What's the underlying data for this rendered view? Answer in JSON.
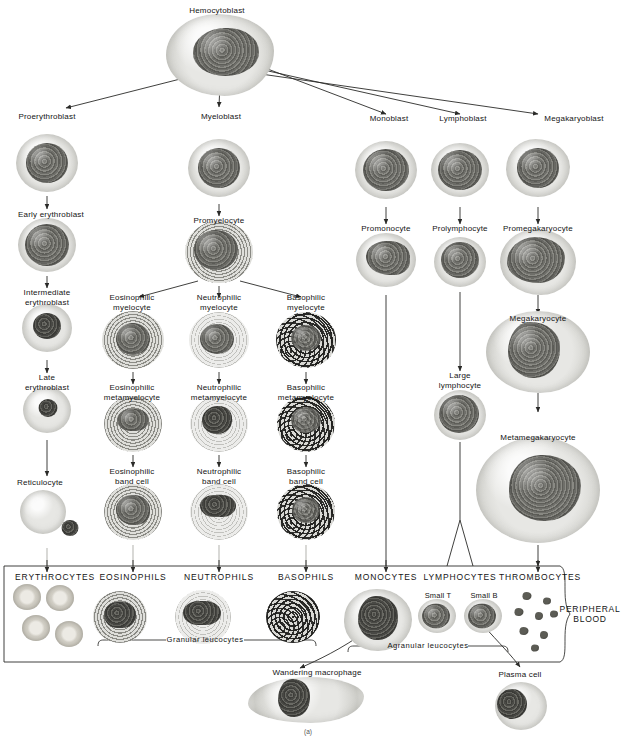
{
  "figure": {
    "caption": "(a)",
    "peripheral_blood_label": "PERIPHERAL\nBLOOD",
    "granular_bracket": "Granular  leucocytes",
    "agranular_bracket": "Agranular  leucocytes"
  },
  "stem": {
    "label": "Hemocytoblast"
  },
  "lineages": {
    "erythroid": {
      "name": "erythroid",
      "stages": [
        {
          "label": "Proerythroblast"
        },
        {
          "label": "Early erythroblast"
        },
        {
          "label": "Intermediate\nerythroblast"
        },
        {
          "label": "Late\nerythroblast"
        },
        {
          "label": "Reticulocyte"
        }
      ]
    },
    "myeloid": {
      "name": "myeloid",
      "blast": {
        "label": "Myeloblast"
      },
      "pro": {
        "label": "Promyelocyte"
      },
      "branches": [
        {
          "name": "eosinophilic",
          "stages": [
            {
              "label": "Eosinophilic\nmyelocyte"
            },
            {
              "label": "Eosinophilic\nmetamyelocyte"
            },
            {
              "label": "Eosinophilic\nband cell"
            }
          ]
        },
        {
          "name": "neutrophilic",
          "stages": [
            {
              "label": "Neutrophilic\nmyelocyte"
            },
            {
              "label": "Neutrophilic\nmetamyelocyte"
            },
            {
              "label": "Neutrophilic\nband cell"
            }
          ]
        },
        {
          "name": "basophilic",
          "stages": [
            {
              "label": "Basophilic\nmyelocyte"
            },
            {
              "label": "Basophilic\nmetamyelocyte"
            },
            {
              "label": "Basophilic\nband cell"
            }
          ]
        }
      ]
    },
    "monocytic": {
      "name": "monocytic",
      "stages": [
        {
          "label": "Monoblast"
        },
        {
          "label": "Promonocyte"
        }
      ]
    },
    "lymphoid": {
      "name": "lymphoid",
      "stages": [
        {
          "label": "Lymphoblast"
        },
        {
          "label": "Prolymphocyte"
        },
        {
          "label": "Large\nlymphocyte"
        }
      ]
    },
    "megakaryocytic": {
      "name": "megakaryocytic",
      "stages": [
        {
          "label": "Megakaryoblast"
        },
        {
          "label": "Promegakaryocyte"
        },
        {
          "label": "Megakaryocyte"
        },
        {
          "label": "Metamegakaryocyte"
        }
      ]
    }
  },
  "peripheral_blood": {
    "cells": [
      {
        "label": "ERYTHROCYTES"
      },
      {
        "label": "EOSINOPHILS"
      },
      {
        "label": "NEUTROPHILS"
      },
      {
        "label": "BASOPHILS"
      },
      {
        "label": "MONOCYTES"
      },
      {
        "label": "LYMPHOCYTES"
      },
      {
        "label": "THROMBOCYTES"
      }
    ],
    "lymphocyte_subtypes": [
      {
        "label": "Small T"
      },
      {
        "label": "Small B"
      }
    ]
  },
  "tissue_cells": [
    {
      "label": "Wandering macrophage"
    },
    {
      "label": "Plasma cell"
    }
  ]
}
